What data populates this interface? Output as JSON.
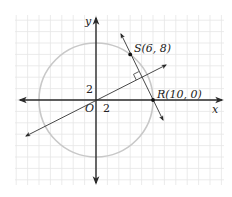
{
  "figure": {
    "type": "coordinate-plane-diagram",
    "axes": {
      "x_label": "x",
      "y_label": "y",
      "origin_label": "O"
    },
    "tick_labels": {
      "x": "2",
      "y": "2"
    },
    "grid": {
      "unit_per_cell": 2,
      "color": "#e6e6e6"
    },
    "circle": {
      "center": [
        0,
        0
      ],
      "radius": 10,
      "color": "#c8c8c8"
    },
    "points": [
      {
        "name": "S",
        "x": 6,
        "y": 8,
        "label": "S(6, 8)"
      },
      {
        "name": "R",
        "x": 10,
        "y": 0,
        "label": "R(10, 0)"
      }
    ],
    "lines": [
      {
        "name": "line-SR",
        "through": [
          "S",
          "R"
        ]
      },
      {
        "name": "perpendicular-bisector",
        "through": [
          [
            0,
            0
          ],
          [
            8,
            4
          ]
        ],
        "right_angle_mark_at": [
          8,
          4
        ]
      }
    ],
    "colors": {
      "axis": "#2a2a2a",
      "line": "#333333",
      "point": "#111111"
    }
  }
}
